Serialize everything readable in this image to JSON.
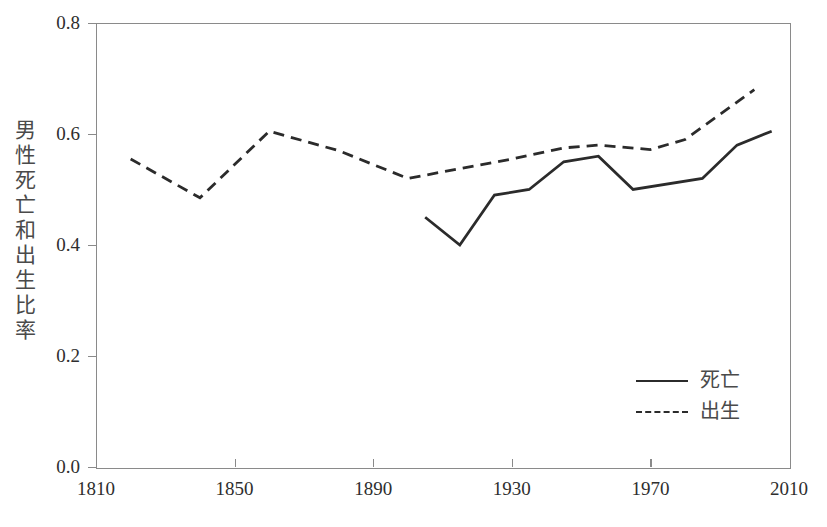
{
  "chart_data": {
    "type": "line",
    "title": "",
    "xlabel": "",
    "ylabel": "男性死亡和出生比率",
    "xlim": [
      1810,
      2010
    ],
    "ylim": [
      0.0,
      0.8
    ],
    "xticks": [
      "1810",
      "1850",
      "1890",
      "1930",
      "1970",
      "2010"
    ],
    "xtick_values": [
      1810,
      1850,
      1890,
      1930,
      1970,
      2010
    ],
    "yticks": [
      "0.0",
      "0.2",
      "0.4",
      "0.6",
      "0.8"
    ],
    "ytick_values": [
      0.0,
      0.2,
      0.4,
      0.6,
      0.8
    ],
    "grid": false,
    "legend_position": "bottom-right",
    "series": [
      {
        "name": "死亡",
        "style": "solid",
        "color": "#2b2b2b",
        "x": [
          1905,
          1915,
          1925,
          1935,
          1945,
          1955,
          1965,
          1985,
          1995,
          2005
        ],
        "values": [
          0.45,
          0.4,
          0.49,
          0.5,
          0.55,
          0.56,
          0.5,
          0.52,
          0.58,
          0.605
        ]
      },
      {
        "name": "出生",
        "style": "dashed",
        "color": "#2b2b2b",
        "x": [
          1820,
          1840,
          1860,
          1880,
          1900,
          1930,
          1945,
          1955,
          1970,
          1980,
          2000
        ],
        "values": [
          0.555,
          0.485,
          0.605,
          0.57,
          0.52,
          0.555,
          0.575,
          0.58,
          0.572,
          0.59,
          0.68
        ]
      }
    ]
  },
  "legend": {
    "entries": [
      {
        "label": "死亡",
        "style": "solid"
      },
      {
        "label": "出生",
        "style": "dashed"
      }
    ]
  },
  "axes": {
    "y_title": "男性死亡和出生比率",
    "frame_color": "#8a8a8a",
    "text_color": "#2e2e2e"
  }
}
